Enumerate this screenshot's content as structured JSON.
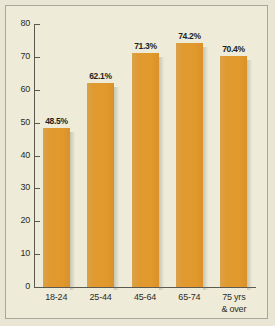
{
  "chart_data": {
    "type": "bar",
    "title": "",
    "subtitle": "",
    "xlabel": "",
    "ylabel": "",
    "ylim": [
      0,
      80
    ],
    "yticks": [
      0,
      10,
      20,
      30,
      40,
      50,
      60,
      70,
      80
    ],
    "grid": false,
    "legend": "none",
    "categories": [
      "18-24",
      "25-44",
      "45-64",
      "65-74",
      "75 yrs & over"
    ],
    "category_lines": [
      [
        "18-24"
      ],
      [
        "25-44"
      ],
      [
        "45-64"
      ],
      [
        "65-74"
      ],
      [
        "75 yrs",
        "& over"
      ]
    ],
    "values": [
      48.5,
      62.1,
      71.3,
      74.2,
      70.4
    ],
    "value_labels": [
      "48.5%",
      "62.1%",
      "71.3%",
      "74.2%",
      "70.4%"
    ],
    "bar_color": "#E09A33",
    "plot_background": "#EFEBD9",
    "axis_color": "#5C5A50",
    "text_color": "#2C2B26"
  }
}
